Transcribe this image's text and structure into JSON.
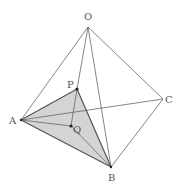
{
  "diagram": {
    "type": "tetrahedron",
    "points": {
      "O": {
        "label": "O",
        "x": 88,
        "y": 27,
        "lx": 84,
        "ly": 20
      },
      "A": {
        "label": "A",
        "x": 21,
        "y": 120,
        "lx": 9,
        "ly": 124
      },
      "B": {
        "label": "B",
        "x": 111,
        "y": 167,
        "lx": 108,
        "ly": 181
      },
      "C": {
        "label": "C",
        "x": 163,
        "y": 99,
        "lx": 165,
        "ly": 103
      },
      "P": {
        "label": "P",
        "x": 77,
        "y": 89,
        "lx": 67,
        "ly": 88
      },
      "Q": {
        "label": "Q",
        "x": 71,
        "y": 126,
        "lx": 73,
        "ly": 133
      }
    },
    "edges": [
      [
        "O",
        "A"
      ],
      [
        "O",
        "B"
      ],
      [
        "O",
        "C"
      ],
      [
        "A",
        "B"
      ],
      [
        "B",
        "C"
      ],
      [
        "A",
        "C"
      ],
      [
        "A",
        "P"
      ],
      [
        "P",
        "B"
      ],
      [
        "P",
        "Q"
      ],
      [
        "A",
        "Q"
      ],
      [
        "Q",
        "B"
      ]
    ],
    "shaded_face": [
      "A",
      "P",
      "B"
    ],
    "colors": {
      "line": "#666666",
      "shade": "#d4d4d4",
      "point": "#222222"
    }
  }
}
